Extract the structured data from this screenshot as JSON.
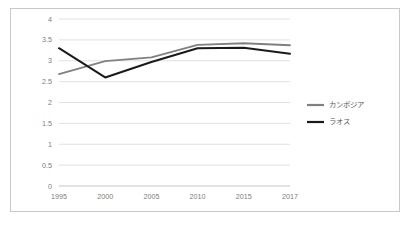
{
  "chart_data": {
    "type": "line",
    "title": "",
    "xlabel": "",
    "ylabel": "",
    "categories": [
      "1995",
      "2000",
      "2005",
      "2010",
      "2015",
      "2017"
    ],
    "ylim": [
      0,
      4
    ],
    "yticks": [
      "0",
      "0.5",
      "1",
      "1.5",
      "2",
      "2.5",
      "3",
      "3.5",
      "4"
    ],
    "ytick_values": [
      0,
      0.5,
      1,
      1.5,
      2,
      2.5,
      3,
      3.5,
      4
    ],
    "grid": "horizontal",
    "legend_position": "right",
    "series": [
      {
        "name": "カンボジア",
        "color": "#808080",
        "values": [
          2.68,
          2.99,
          3.08,
          3.38,
          3.42,
          3.37
        ]
      },
      {
        "name": "ラオス",
        "color": "#1a1a1a",
        "values": [
          3.3,
          2.6,
          2.97,
          3.3,
          3.31,
          3.17
        ]
      }
    ]
  },
  "frame": {
    "border_color": "#c8c8c8",
    "background": "#ffffff"
  },
  "axis": {
    "tick_color": "#7d7d7d",
    "grid_color": "#d9d9d9"
  }
}
